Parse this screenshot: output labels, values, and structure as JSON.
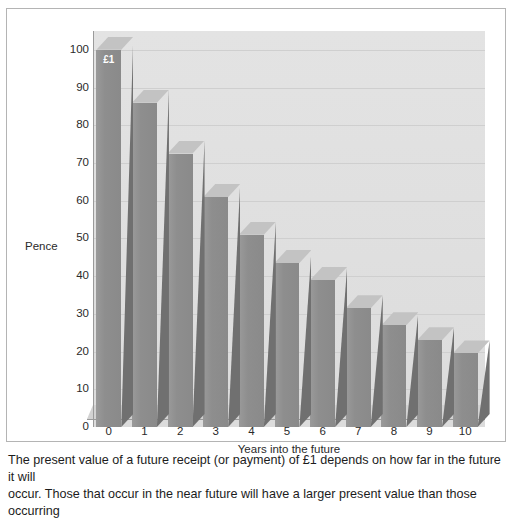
{
  "figure": {
    "caption_line1": "The present value of a future receipt (or payment) of £1 depends on how far in the future it will",
    "caption_line2": "occur. Those that occur in the near future will have a larger present value than those occurring"
  },
  "colors": {
    "bar_front": "#8e8e8e",
    "bar_side": "#707070",
    "bar_top": "#c3c3c3",
    "plot_background": "#dedede",
    "gridline": "#cfcfcf",
    "axis": "#9a9a9a",
    "border": "#b4b4b4",
    "text": "#2a2a2a",
    "bar_label_text": "#ffffff"
  },
  "chart_data": {
    "type": "bar",
    "title": "",
    "xlabel": "Years into the future",
    "ylabel": "Pence",
    "categories": [
      "0",
      "1",
      "2",
      "3",
      "4",
      "5",
      "6",
      "7",
      "8",
      "9",
      "10"
    ],
    "values": [
      100,
      86,
      72.5,
      61,
      51,
      43.5,
      39,
      31.5,
      27,
      23,
      19.5
    ],
    "point_labels": [
      "£1",
      "",
      "",
      "",
      "",
      "",
      "",
      "",
      "",
      "",
      ""
    ],
    "ylim": [
      0,
      105
    ],
    "y_ticks": [
      0,
      10,
      20,
      30,
      40,
      50,
      60,
      70,
      80,
      90,
      100
    ],
    "y_tick_labels": [
      "0",
      "10",
      "20",
      "30",
      "40",
      "50",
      "60",
      "70",
      "80",
      "90",
      "100"
    ],
    "grid": true,
    "grid_axis": "y",
    "legend": "none",
    "style": "3d-bar"
  }
}
